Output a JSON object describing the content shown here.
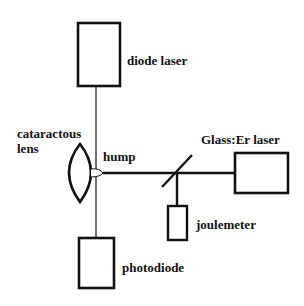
{
  "diagram": {
    "type": "optical-setup-schematic",
    "labels": {
      "diode_laser": "diode laser",
      "cataractous_lens_line1": "cataractous",
      "cataractous_lens_line2": "lens",
      "hump": "hump",
      "glass_er_laser": "Glass:Er laser",
      "joulemeter": "joulemeter",
      "photodiode": "photodiode"
    },
    "components": [
      {
        "id": "diode-laser",
        "shape": "rectangle",
        "label_key": "diode_laser"
      },
      {
        "id": "cataractous-lens",
        "shape": "biconvex-lens",
        "label_key": "cataractous_lens"
      },
      {
        "id": "hump",
        "shape": "small-bump",
        "label_key": "hump"
      },
      {
        "id": "beam-splitter",
        "shape": "diagonal-line"
      },
      {
        "id": "glass-er-laser",
        "shape": "rectangle",
        "label_key": "glass_er_laser"
      },
      {
        "id": "joulemeter",
        "shape": "rectangle",
        "label_key": "joulemeter"
      },
      {
        "id": "photodiode",
        "shape": "rectangle",
        "label_key": "photodiode"
      }
    ],
    "connections": [
      {
        "from": "diode-laser",
        "to": "photodiode",
        "style": "thin-vertical-beam"
      },
      {
        "from": "glass-er-laser",
        "to": "hump",
        "style": "thick-horizontal-beam"
      },
      {
        "from": "beam-splitter",
        "to": "joulemeter",
        "style": "thick-vertical-beam"
      }
    ],
    "colors": {
      "stroke": "#111111",
      "background": "#ffffff"
    }
  }
}
